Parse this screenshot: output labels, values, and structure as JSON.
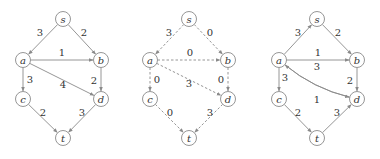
{
  "figure": {
    "graphs": [
      {
        "id": "original-graph",
        "style": "solid",
        "nodes": [
          {
            "id": "s",
            "label": "s",
            "x": 63,
            "y": 19
          },
          {
            "id": "a",
            "label": "a",
            "x": 23,
            "y": 60
          },
          {
            "id": "b",
            "label": "b",
            "x": 101,
            "y": 60
          },
          {
            "id": "c",
            "label": "c",
            "x": 23,
            "y": 99
          },
          {
            "id": "d",
            "label": "d",
            "x": 101,
            "y": 99
          },
          {
            "id": "t",
            "label": "t",
            "x": 63,
            "y": 138
          }
        ],
        "edges": [
          {
            "from": "s",
            "to": "a",
            "weight": "3",
            "lx": 40,
            "ly": 32
          },
          {
            "from": "s",
            "to": "b",
            "weight": "2",
            "lx": 84,
            "ly": 32
          },
          {
            "from": "a",
            "to": "b",
            "weight": "1",
            "lx": 62,
            "ly": 52
          },
          {
            "from": "a",
            "to": "c",
            "weight": "3",
            "lx": 30,
            "ly": 79
          },
          {
            "from": "a",
            "to": "d",
            "weight": "4",
            "lx": 63,
            "ly": 84
          },
          {
            "from": "b",
            "to": "d",
            "weight": "2",
            "lx": 94,
            "ly": 80
          },
          {
            "from": "c",
            "to": "t",
            "weight": "2",
            "lx": 43,
            "ly": 112
          },
          {
            "from": "d",
            "to": "t",
            "weight": "3",
            "lx": 82,
            "ly": 112
          }
        ]
      },
      {
        "id": "residual-flow-graph",
        "style": "dashed",
        "nodes": [
          {
            "id": "s",
            "label": "s",
            "x": 189,
            "y": 19
          },
          {
            "id": "a",
            "label": "a",
            "x": 150,
            "y": 60
          },
          {
            "id": "b",
            "label": "b",
            "x": 228,
            "y": 60
          },
          {
            "id": "c",
            "label": "c",
            "x": 150,
            "y": 99
          },
          {
            "id": "d",
            "label": "d",
            "x": 228,
            "y": 99
          },
          {
            "id": "t",
            "label": "t",
            "x": 189,
            "y": 138
          }
        ],
        "edges": [
          {
            "from": "s",
            "to": "a",
            "weight": "3",
            "lx": 169,
            "ly": 32
          },
          {
            "from": "s",
            "to": "b",
            "weight": "0",
            "lx": 210,
            "ly": 32
          },
          {
            "from": "a",
            "to": "b",
            "weight": "0",
            "lx": 190,
            "ly": 52
          },
          {
            "from": "a",
            "to": "c",
            "weight": "0",
            "lx": 157,
            "ly": 79
          },
          {
            "from": "a",
            "to": "d",
            "weight": "3",
            "lx": 189,
            "ly": 83
          },
          {
            "from": "b",
            "to": "d",
            "weight": "0",
            "lx": 221,
            "ly": 79
          },
          {
            "from": "c",
            "to": "t",
            "weight": "0",
            "lx": 170,
            "ly": 112
          },
          {
            "from": "d",
            "to": "t",
            "weight": "3",
            "lx": 210,
            "ly": 112
          }
        ]
      },
      {
        "id": "residual-graph",
        "style": "solid",
        "nodes": [
          {
            "id": "s",
            "label": "s",
            "x": 317,
            "y": 19
          },
          {
            "id": "a",
            "label": "a",
            "x": 279,
            "y": 60
          },
          {
            "id": "b",
            "label": "b",
            "x": 357,
            "y": 60
          },
          {
            "id": "c",
            "label": "c",
            "x": 279,
            "y": 99
          },
          {
            "id": "d",
            "label": "d",
            "x": 357,
            "y": 99
          },
          {
            "id": "t",
            "label": "t",
            "x": 317,
            "y": 138
          }
        ],
        "edges": [
          {
            "from": "a",
            "to": "s",
            "weight": "3",
            "lx": 298,
            "ly": 32
          },
          {
            "from": "s",
            "to": "b",
            "weight": "2",
            "lx": 338,
            "ly": 32
          },
          {
            "from": "a",
            "to": "b",
            "weight": "1",
            "lx": 318,
            "ly": 52
          },
          {
            "from": "d",
            "to": "a",
            "weight": "3",
            "lx": 317,
            "ly": 66,
            "curve": -10
          },
          {
            "from": "a",
            "to": "d",
            "weight": "1",
            "lx": 317,
            "ly": 99,
            "curve": 10
          },
          {
            "from": "a",
            "to": "c",
            "weight": "3",
            "lx": 285,
            "ly": 77
          },
          {
            "from": "b",
            "to": "d",
            "weight": "2",
            "lx": 350,
            "ly": 80
          },
          {
            "from": "c",
            "to": "t",
            "weight": "2",
            "lx": 298,
            "ly": 112
          },
          {
            "from": "t",
            "to": "d",
            "weight": "3",
            "lx": 337,
            "ly": 112
          }
        ]
      }
    ],
    "node_radius": 7.5,
    "colors": {
      "stroke": "#8a8a8a",
      "text": "#333333",
      "background": "#ffffff"
    }
  }
}
